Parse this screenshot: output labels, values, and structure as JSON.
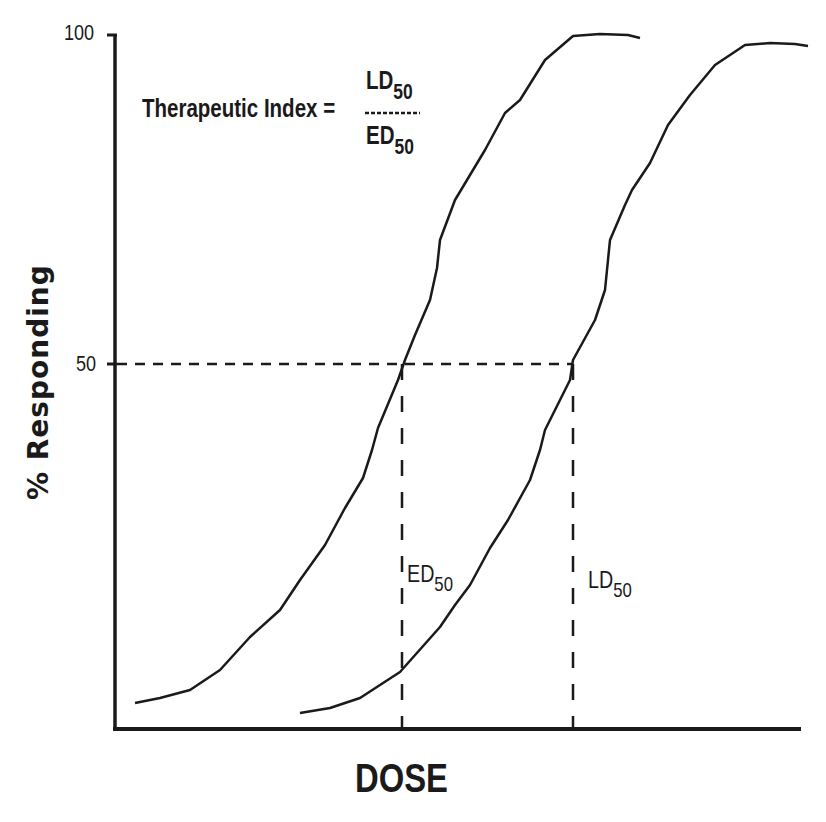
{
  "chart_data": {
    "type": "line",
    "title": "",
    "xlabel": "DOSE",
    "ylabel": "% Responding",
    "ylim": [
      0,
      100
    ],
    "yticks": [
      "100",
      "50"
    ],
    "grid": false,
    "legend": "none",
    "annotation": {
      "formula_left": "Therapeutic Index =",
      "numerator": "LD",
      "numerator_sub": "50",
      "denominator": "ED",
      "denominator_sub": "50"
    },
    "markers": [
      {
        "label": "ED",
        "sub": "50",
        "dose_px": 402,
        "response": 50
      },
      {
        "label": "LD",
        "sub": "50",
        "dose_px": 573,
        "response": 50
      }
    ],
    "series": [
      {
        "name": "Effective dose curve (ED)",
        "points_px": [
          [
            135,
            703
          ],
          [
            160,
            698
          ],
          [
            190,
            690
          ],
          [
            220,
            670
          ],
          [
            250,
            637
          ],
          [
            280,
            610
          ],
          [
            300,
            580
          ],
          [
            325,
            545
          ],
          [
            345,
            508
          ],
          [
            363,
            478
          ],
          [
            372,
            450
          ],
          [
            378,
            428
          ],
          [
            398,
            380
          ],
          [
            405,
            360
          ],
          [
            415,
            335
          ],
          [
            430,
            300
          ],
          [
            437,
            268
          ],
          [
            440,
            240
          ],
          [
            455,
            200
          ],
          [
            485,
            150
          ],
          [
            505,
            113
          ],
          [
            520,
            100
          ],
          [
            545,
            60
          ],
          [
            573,
            36
          ],
          [
            600,
            34
          ],
          [
            628,
            35
          ],
          [
            640,
            38
          ]
        ]
      },
      {
        "name": "Lethal dose curve (LD)",
        "points_px": [
          [
            300,
            713
          ],
          [
            330,
            708
          ],
          [
            360,
            698
          ],
          [
            400,
            672
          ],
          [
            440,
            627
          ],
          [
            455,
            605
          ],
          [
            470,
            585
          ],
          [
            490,
            548
          ],
          [
            508,
            520
          ],
          [
            530,
            480
          ],
          [
            540,
            450
          ],
          [
            545,
            430
          ],
          [
            570,
            380
          ],
          [
            573,
            360
          ],
          [
            595,
            320
          ],
          [
            605,
            290
          ],
          [
            610,
            240
          ],
          [
            625,
            205
          ],
          [
            632,
            190
          ],
          [
            650,
            163
          ],
          [
            668,
            125
          ],
          [
            690,
            95
          ],
          [
            715,
            65
          ],
          [
            745,
            45
          ],
          [
            770,
            43
          ],
          [
            795,
            44
          ],
          [
            808,
            46
          ]
        ]
      }
    ]
  }
}
